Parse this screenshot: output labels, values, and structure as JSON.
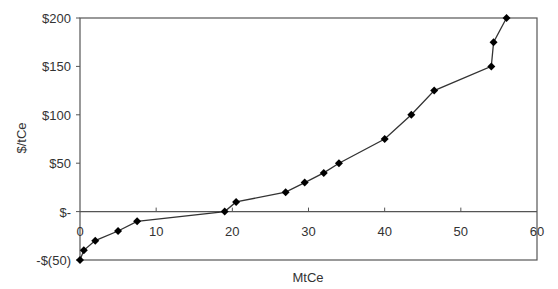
{
  "chart_data": {
    "type": "line",
    "title": "",
    "xlabel": "MtCe",
    "ylabel": "$/tCe",
    "xlim": [
      0,
      60
    ],
    "ylim": [
      -50,
      200
    ],
    "grid": false,
    "legend": null,
    "x_ticks": [
      0,
      10,
      20,
      30,
      40,
      50,
      60
    ],
    "x_tick_labels": [
      "0",
      "10",
      "20",
      "30",
      "40",
      "50",
      "60"
    ],
    "y_ticks": [
      -50,
      0,
      50,
      100,
      150,
      200
    ],
    "y_tick_labels": [
      "-$(50)",
      "$-",
      "$50",
      "$100",
      "$150",
      "$200"
    ],
    "series": [
      {
        "name": "Marginal abatement cost",
        "marker": "diamond",
        "color": "#111111",
        "x": [
          0,
          0.5,
          2,
          5,
          7.5,
          19,
          20.5,
          27,
          29.5,
          32,
          34,
          40,
          43.5,
          46.5,
          54,
          54.3,
          56
        ],
        "y": [
          -50,
          -40,
          -30,
          -20,
          -10,
          0,
          10,
          20,
          30,
          40,
          50,
          75,
          100,
          125,
          150,
          175,
          200
        ]
      }
    ]
  },
  "colors": {
    "axis": "#555555",
    "line": "#333333",
    "marker": "#000000"
  }
}
